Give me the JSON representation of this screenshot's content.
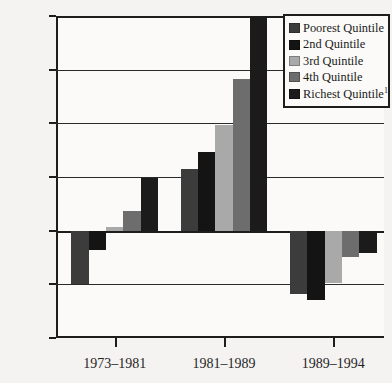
{
  "chart_data": {
    "type": "bar",
    "title": "",
    "subtitle": "",
    "xlabel": "",
    "ylabel": "",
    "categories": [
      "1973–1981",
      "1981–1989",
      "1989–1994"
    ],
    "ylim": [
      -10,
      20
    ],
    "yticks": [
      20,
      15,
      10,
      5,
      0,
      -5,
      -10
    ],
    "ytick_labels": [
      "20%",
      "15%",
      "10%",
      "5%",
      "0%",
      "-5%",
      "-10%"
    ],
    "grid": true,
    "legend_position": "top-right",
    "value_suffix": "%",
    "series": [
      {
        "name": "Poorest Quintile",
        "color": "#3c3c3c",
        "values": [
          -5.0,
          5.7,
          -5.9
        ]
      },
      {
        "name": "2nd Quintile",
        "color": "#141414",
        "values": [
          -1.8,
          7.3,
          -6.5
        ]
      },
      {
        "name": "3rd Quintile",
        "color": "#a9a9a9",
        "values": [
          0.3,
          9.8,
          -4.9
        ]
      },
      {
        "name": "4th Quintile",
        "color": "#6d6d6d",
        "values": [
          1.8,
          14.1,
          -2.5
        ]
      },
      {
        "name": "Richest Quintile",
        "footnote_marker": "1",
        "color": "#1b1b1b",
        "values": [
          4.9,
          21.6,
          -2.1
        ],
        "notes": "Richest Quintile bar for 1981–1989 is clipped by the top of the plot area"
      }
    ]
  },
  "legend": {
    "entries": [
      {
        "label": "Poorest Quintile",
        "marker": ""
      },
      {
        "label": "2nd Quintile",
        "marker": ""
      },
      {
        "label": "3rd Quintile",
        "marker": ""
      },
      {
        "label": "4th Quintile",
        "marker": ""
      },
      {
        "label": "Richest Quintile",
        "marker": "1"
      }
    ]
  }
}
